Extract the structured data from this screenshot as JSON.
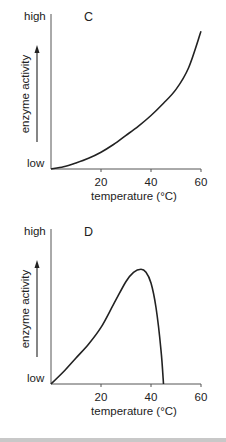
{
  "chart_data": [
    {
      "type": "line",
      "title": "C",
      "xlabel": "temperature (°C)",
      "ylabel": "enzyme activity",
      "y_tick_labels": {
        "top": "high",
        "bottom": "low"
      },
      "x_ticks": [
        20,
        40,
        60
      ],
      "xlim": [
        0,
        60
      ],
      "ylim": [
        0,
        100
      ],
      "grid": false,
      "x": [
        0,
        5,
        10,
        15,
        20,
        25,
        30,
        35,
        40,
        45,
        50,
        55,
        60
      ],
      "y": [
        0,
        1.5,
        4,
        7,
        11,
        16,
        22,
        28,
        35,
        43,
        52,
        66,
        90
      ]
    },
    {
      "type": "line",
      "title": "D",
      "xlabel": "temperature (°C)",
      "ylabel": "enzyme activity",
      "y_tick_labels": {
        "top": "high",
        "bottom": "low"
      },
      "x_ticks": [
        20,
        40,
        60
      ],
      "xlim": [
        0,
        60
      ],
      "ylim": [
        0,
        100
      ],
      "grid": false,
      "x": [
        0,
        5,
        10,
        15,
        20,
        25,
        30,
        33,
        36,
        38,
        40,
        42,
        44,
        45
      ],
      "y": [
        0,
        8,
        17,
        26,
        37,
        52,
        67,
        73,
        75,
        73,
        66,
        50,
        22,
        0
      ]
    }
  ],
  "panels": [
    {
      "letter": "C",
      "high": "high",
      "low": "low",
      "ylabel": "enzyme activity",
      "xlabel": "temperature (°C)",
      "ticks": [
        "20",
        "40",
        "60"
      ]
    },
    {
      "letter": "D",
      "high": "high",
      "low": "low",
      "ylabel": "enzyme activity",
      "xlabel": "temperature (°C)",
      "ticks": [
        "20",
        "40",
        "60"
      ]
    }
  ],
  "colors": {
    "line": "#222222",
    "axis": "#555555",
    "footer": "#c8c8c8"
  }
}
